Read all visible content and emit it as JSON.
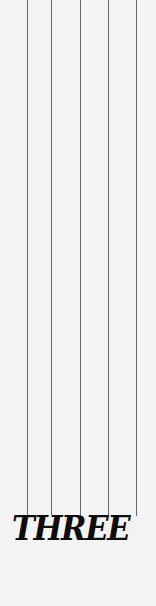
{
  "title": "THREE",
  "colors": {
    "background": "#f3f3f3",
    "string": "#6a6a6a",
    "text": "#0d0d0d"
  },
  "strings": [
    {
      "x": 27,
      "length": 518
    },
    {
      "x": 51,
      "length": 515
    },
    {
      "x": 80,
      "length": 518
    },
    {
      "x": 108,
      "length": 516
    },
    {
      "x": 136,
      "length": 516
    }
  ]
}
